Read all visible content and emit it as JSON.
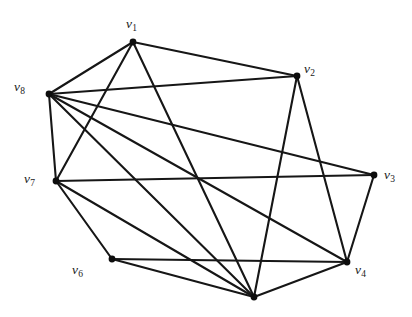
{
  "figure": {
    "kind": "undirected-graph-diagram",
    "background_color": "#ffffff",
    "edge_color": "#161616",
    "vertex_color": "#0d0d0d",
    "label_color": "#1a1a1a",
    "width": 412,
    "height": 317
  },
  "chart_data": {
    "type": "diagram",
    "title": "",
    "xlabel": "",
    "ylabel": "",
    "graph_type": "undirected simple graph",
    "vertex_count": 8,
    "edge_count": 18,
    "nodes": [
      {
        "id": "v1",
        "label": "v",
        "sub": "1",
        "x": 133,
        "y": 42,
        "label_x": 126,
        "label_y": 17,
        "degree": 4
      },
      {
        "id": "v2",
        "label": "v",
        "sub": "2",
        "x": 297,
        "y": 76,
        "label_x": 304,
        "label_y": 62,
        "degree": 4
      },
      {
        "id": "v3",
        "label": "v",
        "sub": "3",
        "x": 374,
        "y": 175,
        "label_x": 384,
        "label_y": 168,
        "degree": 3
      },
      {
        "id": "v4",
        "label": "v",
        "sub": "4",
        "x": 347,
        "y": 262,
        "label_x": 355,
        "label_y": 263,
        "degree": 5
      },
      {
        "id": "v5",
        "label": "",
        "sub": "",
        "x": 254,
        "y": 297,
        "label_x": 248,
        "label_y": 303,
        "degree": 6
      },
      {
        "id": "v6",
        "label": "v",
        "sub": "6",
        "x": 112,
        "y": 259,
        "label_x": 72,
        "label_y": 263,
        "degree": 3
      },
      {
        "id": "v7",
        "label": "v",
        "sub": "7",
        "x": 56,
        "y": 181,
        "label_x": 24,
        "label_y": 172,
        "degree": 4
      },
      {
        "id": "v8",
        "label": "v",
        "sub": "8",
        "x": 49,
        "y": 94,
        "label_x": 14,
        "label_y": 80,
        "degree": 7
      }
    ],
    "edges": [
      {
        "source": "v1",
        "target": "v2"
      },
      {
        "source": "v1",
        "target": "v8"
      },
      {
        "source": "v1",
        "target": "v7"
      },
      {
        "source": "v1",
        "target": "v5"
      },
      {
        "source": "v2",
        "target": "v8"
      },
      {
        "source": "v2",
        "target": "v4"
      },
      {
        "source": "v2",
        "target": "v5"
      },
      {
        "source": "v3",
        "target": "v8"
      },
      {
        "source": "v3",
        "target": "v7"
      },
      {
        "source": "v3",
        "target": "v4"
      },
      {
        "source": "v4",
        "target": "v6"
      },
      {
        "source": "v4",
        "target": "v5"
      },
      {
        "source": "v4",
        "target": "v8"
      },
      {
        "source": "v5",
        "target": "v6"
      },
      {
        "source": "v5",
        "target": "v7"
      },
      {
        "source": "v5",
        "target": "v8"
      },
      {
        "source": "v6",
        "target": "v7"
      },
      {
        "source": "v7",
        "target": "v8"
      }
    ]
  }
}
